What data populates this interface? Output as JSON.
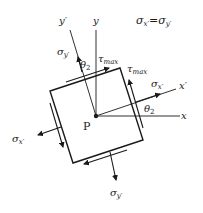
{
  "diagram": {
    "title_equation": "σx′=σy′",
    "axes": {
      "x": "x",
      "y": "y",
      "x_prime": "x′",
      "y_prime": "y′"
    },
    "origin_label": "P",
    "angle_label": "θ2",
    "stresses": {
      "sigma_x_prime": "σx′",
      "sigma_y_prime": "σy′",
      "tau_max": "τmax"
    },
    "labels": {
      "eq_sigma_x": "σ",
      "eq_sub_x": "x′",
      "eq_eq": "=",
      "eq_sigma_y": "σ",
      "eq_sub_y": "y′",
      "y": "y",
      "y_prime": "y′",
      "x": "x",
      "x_prime": "x′",
      "P": "P",
      "theta_top_main": "θ",
      "theta_top_sub": "2",
      "theta_right_main": "θ",
      "theta_right_sub": "2",
      "tau_top_main": "τ",
      "tau_top_sub": "max",
      "tau_right_main": "τ",
      "tau_right_sub": "max",
      "sig_y_top_main": "σ",
      "sig_y_top_sub": "y′",
      "sig_x_right_main": "σ",
      "sig_x_right_sub": "x′",
      "sig_x_left_main": "σ",
      "sig_x_left_sub": "x′",
      "sig_y_bottom_main": "σ",
      "sig_y_bottom_sub": "y′"
    },
    "colors": {
      "ink": "#1a1a1a",
      "background": "#ffffff"
    }
  }
}
